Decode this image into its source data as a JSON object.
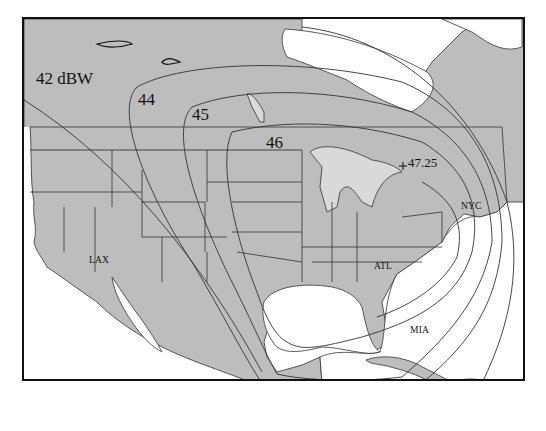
{
  "figure": {
    "type": "satellite EIRP footprint contour map",
    "unit": "dBW",
    "colors": {
      "land": "#bdbdbd",
      "water": "#ffffff",
      "lake": "#d9d9d9",
      "contour": "#333333",
      "border": "#111111"
    }
  },
  "contours": [
    {
      "label": "42 dBW",
      "value": 42
    },
    {
      "label": "44",
      "value": 44
    },
    {
      "label": "45",
      "value": 45
    },
    {
      "label": "46",
      "value": 46
    }
  ],
  "peak": {
    "label": "47.25",
    "value": 47.25,
    "marker": "plus-marker"
  },
  "cities": [
    {
      "code": "LAX"
    },
    {
      "code": "NYC"
    },
    {
      "code": "ATL"
    },
    {
      "code": "MIA"
    },
    {
      "code": "MEX"
    }
  ]
}
